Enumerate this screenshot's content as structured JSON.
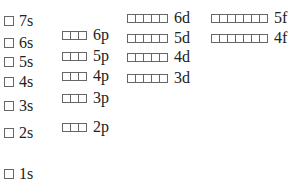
{
  "diagram": {
    "type": "orbital-energy-boxes",
    "s_orbitals": [
      {
        "label": "7s",
        "boxes": 1,
        "x": 4,
        "y": 13
      },
      {
        "label": "6s",
        "boxes": 1,
        "x": 4,
        "y": 35
      },
      {
        "label": "5s",
        "boxes": 1,
        "x": 4,
        "y": 54
      },
      {
        "label": "4s",
        "boxes": 1,
        "x": 4,
        "y": 74
      },
      {
        "label": "3s",
        "boxes": 1,
        "x": 4,
        "y": 98
      },
      {
        "label": "2s",
        "boxes": 1,
        "x": 4,
        "y": 125
      },
      {
        "label": "1s",
        "boxes": 1,
        "x": 4,
        "y": 166
      }
    ],
    "p_orbitals": [
      {
        "label": "6p",
        "boxes": 3,
        "x": 62,
        "y": 27
      },
      {
        "label": "5p",
        "boxes": 3,
        "x": 62,
        "y": 48
      },
      {
        "label": "4p",
        "boxes": 3,
        "x": 62,
        "y": 68
      },
      {
        "label": "3p",
        "boxes": 3,
        "x": 62,
        "y": 90
      },
      {
        "label": "2p",
        "boxes": 3,
        "x": 62,
        "y": 119
      }
    ],
    "d_orbitals": [
      {
        "label": "6d",
        "boxes": 5,
        "x": 127,
        "y": 10
      },
      {
        "label": "5d",
        "boxes": 5,
        "x": 127,
        "y": 30
      },
      {
        "label": "4d",
        "boxes": 5,
        "x": 127,
        "y": 49
      },
      {
        "label": "3d",
        "boxes": 5,
        "x": 127,
        "y": 70
      }
    ],
    "f_orbitals": [
      {
        "label": "5f",
        "boxes": 7,
        "x": 211,
        "y": 10
      },
      {
        "label": "4f",
        "boxes": 7,
        "x": 211,
        "y": 30
      }
    ]
  }
}
